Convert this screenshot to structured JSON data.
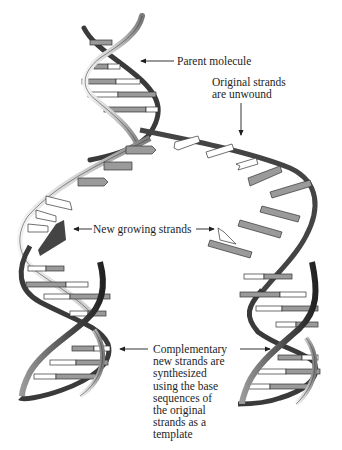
{
  "figure": {
    "colors": {
      "background": "#ffffff",
      "backbone_dark": "#3a3a3a",
      "backbone_mid": "#8a8a8a",
      "backbone_light": "#e6e6e6",
      "base_gray": "#9a9a9a",
      "base_white": "#ffffff",
      "outline": "#222222",
      "text": "#1e1e1e"
    }
  },
  "labels": {
    "parent_molecule": "Parent molecule",
    "original_strands": [
      "Original strands",
      "are unwound"
    ],
    "new_growing_strands": "New growing strands",
    "complementary": [
      "Complementary",
      "new strands are",
      "synthesized",
      "using the base",
      "sequences of",
      "the original",
      "strands as a",
      "template"
    ]
  },
  "arrows": [
    {
      "name": "parent-molecule-arrow",
      "direction": "left"
    },
    {
      "name": "original-strands-arrow",
      "direction": "down"
    },
    {
      "name": "new-growing-strands-left-arrow",
      "direction": "left"
    },
    {
      "name": "new-growing-strands-right-arrow",
      "direction": "right"
    },
    {
      "name": "complementary-left-arrow",
      "direction": "left"
    },
    {
      "name": "complementary-right-arrow",
      "direction": "right"
    }
  ],
  "structures": [
    {
      "name": "parent-helix",
      "description": "double helix at top"
    },
    {
      "name": "replication-fork",
      "description": "unwound strands with exposed bases"
    },
    {
      "name": "left-daughter-helix",
      "description": "daughter double helix, bottom left"
    },
    {
      "name": "right-daughter-helix",
      "description": "daughter double helix, bottom right"
    }
  ]
}
